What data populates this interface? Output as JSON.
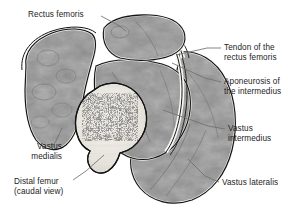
{
  "figure": {
    "view": "caudal view",
    "palette": {
      "background": "#ffffff",
      "muscle_mid": "#8a8a8a",
      "muscle_dark": "#5e5e5e",
      "muscle_light": "#a6a6a6",
      "fascia_white": "#f7f7f4",
      "outline_black": "#111111",
      "bone_cortex": "#e9e7e1",
      "bone_trabecula": "#4a4a4a",
      "label_text": "#1c1c1c",
      "leader_line": "#6f6f6f"
    }
  },
  "labels": [
    {
      "id": "rectus-femoris",
      "text": "Rectus femoris",
      "align": "left",
      "x": 28,
      "y": 10,
      "leader": [
        [
          101,
          16
        ],
        [
          118,
          25
        ],
        [
          126,
          31
        ]
      ]
    },
    {
      "id": "tendon-rectus-femoris",
      "text": "Tendon of the\nrectus femoris",
      "align": "left",
      "x": 224,
      "y": 43,
      "leader": [
        [
          221,
          48
        ],
        [
          207,
          48
        ],
        [
          176,
          55
        ]
      ]
    },
    {
      "id": "aponeurosis-intermedius",
      "text": "Aponeurosis of\nthe intermedius",
      "align": "left",
      "x": 224,
      "y": 77,
      "leader": [
        [
          221,
          82
        ],
        [
          205,
          78
        ],
        [
          172,
          63
        ]
      ]
    },
    {
      "id": "vastus-intermedius",
      "text": "Vastus\nintermedius",
      "align": "left",
      "x": 228,
      "y": 124,
      "leader": [
        [
          225,
          129
        ],
        [
          208,
          126
        ],
        [
          163,
          110
        ]
      ]
    },
    {
      "id": "vastus-lateralis",
      "text": "Vastus lateralis",
      "align": "left",
      "x": 222,
      "y": 178,
      "leader": [
        [
          219,
          182
        ],
        [
          205,
          176
        ],
        [
          188,
          159
        ]
      ]
    },
    {
      "id": "vastus-medialis",
      "text": "Vastus\nmedialis",
      "align": "right",
      "x": 10,
      "y": 142,
      "leader": [
        [
          52,
          147
        ],
        [
          56,
          141
        ],
        [
          62,
          128
        ]
      ]
    },
    {
      "id": "distal-femur",
      "text": "Distal femur\n(caudal view)",
      "align": "left",
      "x": 14,
      "y": 177,
      "leader": [
        [
          73,
          180
        ],
        [
          86,
          171
        ],
        [
          104,
          155
        ]
      ]
    }
  ]
}
